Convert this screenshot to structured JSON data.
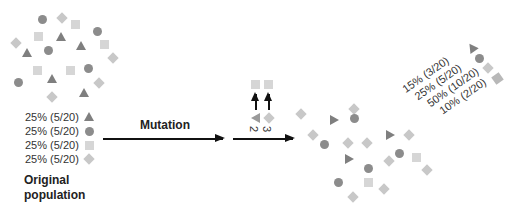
{
  "original": {
    "title": "Original population",
    "legend": [
      {
        "label": "25% (5/20)",
        "shape": "triangle"
      },
      {
        "label": "25% (5/20)",
        "shape": "circle"
      },
      {
        "label": "25% (5/20)",
        "shape": "square"
      },
      {
        "label": "25% (5/20)",
        "shape": "diamond"
      }
    ]
  },
  "process": {
    "mutation_label": "Mutation",
    "mutations": [
      {
        "from": "triangle",
        "to": "square",
        "count_label": "2"
      },
      {
        "from": "diamond",
        "to": "square",
        "count_label": "3"
      }
    ]
  },
  "result": {
    "legend": [
      {
        "label": "15% (3/20)",
        "shape": "triangle"
      },
      {
        "label": "25% (5/20)",
        "shape": "circle"
      },
      {
        "label": "50% (10/20)",
        "shape": "diamond"
      },
      {
        "label": "10% (2/20)",
        "shape": "square"
      }
    ]
  },
  "colors": {
    "triangle": "#7f7f7f",
    "circle": "#8c8c8c",
    "square": "#d6d6d6",
    "diamond": "#c8c8c8",
    "arrow": "#111111"
  }
}
